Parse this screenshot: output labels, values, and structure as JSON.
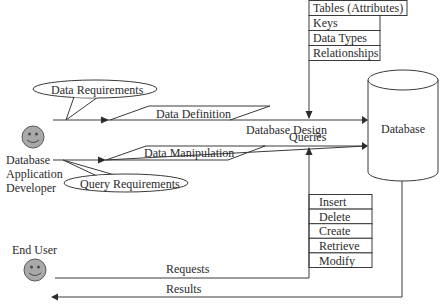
{
  "diagram": {
    "actors": {
      "developer": {
        "label_lines": [
          "Database",
          "Application",
          "Developer"
        ]
      },
      "end_user": {
        "label": "End User"
      }
    },
    "callouts": {
      "data_requirements": "Data Requirements",
      "query_requirements": "Query Requirements"
    },
    "flows": {
      "data_definition": "Data Definition",
      "data_manipulation": "Data Manipulation",
      "database_design": "Database Design",
      "queries": "Queries",
      "requests": "Requests",
      "results": "Results"
    },
    "database": {
      "label": "Database"
    },
    "design_items": [
      "Tables (Attributes)",
      "Keys",
      "Data Types",
      "Relationships"
    ],
    "operations": [
      "Insert",
      "Delete",
      "Create",
      "Retrieve",
      "Modify"
    ],
    "colors": {
      "line": "#3a3a3a",
      "face": "#a9a9a9",
      "text": "#2b2b2b"
    }
  }
}
